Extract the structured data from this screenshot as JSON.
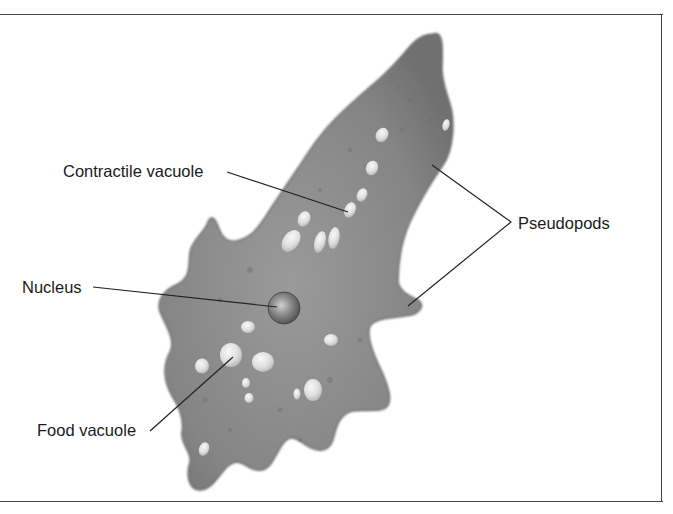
{
  "diagram": {
    "labels": {
      "contractile_vacuole": "Contractile vacuole",
      "nucleus": "Nucleus",
      "food_vacuole": "Food vacuole",
      "pseudopods": "Pseudopods"
    },
    "colors": {
      "cell_body": "#8a8a8a",
      "cell_edge": "#6a6a6a",
      "vacuole": "#e6e6e6",
      "nucleus": "#6e6e6e",
      "leader_line": "#222222",
      "frame": "#444444",
      "text": "#1a1a1a"
    }
  }
}
